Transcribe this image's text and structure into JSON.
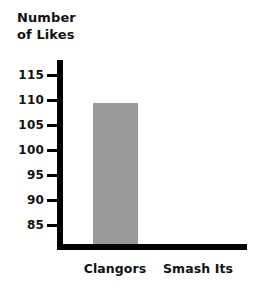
{
  "chart_data": {
    "type": "bar",
    "title": "Number\nof Likes",
    "xlabel": "",
    "ylabel": "Number of Likes",
    "categories": [
      "Clangors",
      "Smash Its"
    ],
    "values": [
      109.5,
      85
    ],
    "series": [
      {
        "name": "Number of Likes",
        "values": [
          109.5,
          85
        ]
      }
    ],
    "ylim": [
      82,
      117
    ],
    "yticks": [
      115,
      110,
      105,
      100,
      95,
      90,
      85
    ],
    "ytick_labels": [
      "115",
      "110",
      "105",
      "100",
      "95",
      "90",
      "85"
    ],
    "grid": false,
    "legend": false,
    "bar_colors": [
      "#9a9a9a",
      "#ffffff"
    ],
    "axis_color": "#000000",
    "background": "#ffffff"
  },
  "axis": {
    "title_text": "Number\nof Likes",
    "ticks": [
      {
        "label": "115",
        "value": 115
      },
      {
        "label": "110",
        "value": 110
      },
      {
        "label": "105",
        "value": 105
      },
      {
        "label": "100",
        "value": 100
      },
      {
        "label": "95",
        "value": 95
      },
      {
        "label": "90",
        "value": 90
      },
      {
        "label": "85",
        "value": 85
      }
    ]
  },
  "bars": [
    {
      "label": "Clangors",
      "value": 109.5,
      "color": "#9a9a9a"
    },
    {
      "label": "Smash Its",
      "value": 85,
      "color": "#ffffff"
    }
  ]
}
